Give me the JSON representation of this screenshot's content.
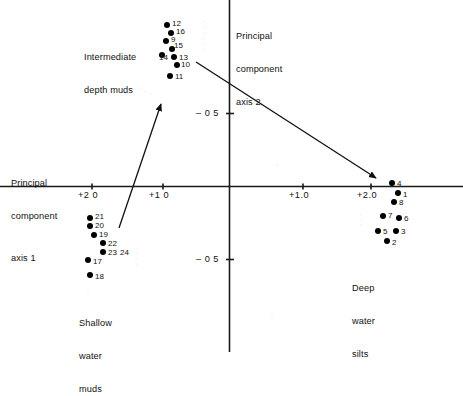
{
  "chart_data": {
    "type": "scatter",
    "title": "",
    "xlabel": "Principal component axis 1",
    "ylabel": "Principal component axis 2",
    "axis1_label_lines": [
      "Principal",
      "component",
      "axis 1"
    ],
    "axis2_label_lines": [
      "Principal",
      "component",
      "axis 2"
    ],
    "xlim": [
      -2.55,
      2.8
    ],
    "ylim": [
      -1.0,
      1.0
    ],
    "grid": false,
    "legend": "none",
    "x_ticks": [
      {
        "label": "+2 0",
        "value": -2.0
      },
      {
        "label": "+1 0",
        "value": -1.0
      },
      {
        "label": "+1.0",
        "value": 1.0
      },
      {
        "label": "+2.0",
        "value": 2.0
      }
    ],
    "y_ticks": [
      {
        "label": "– 0 5",
        "value": 0.5
      },
      {
        "label": "– 0 5",
        "value": -0.5
      }
    ],
    "annotations": [
      {
        "name": "intermediate-depth-muds",
        "lines": [
          "Intermediate",
          "depth muds"
        ]
      },
      {
        "name": "shallow-water-muds",
        "lines": [
          "Shallow",
          "water",
          "muds"
        ]
      },
      {
        "name": "deep-water-silts",
        "lines": [
          "Deep",
          "water",
          "silts"
        ]
      }
    ],
    "arrows": [
      {
        "name": "arrow-to-intermediate-muds",
        "x1": 119,
        "y1": 228,
        "x2": 161,
        "y2": 104
      },
      {
        "name": "arrow-to-deep-silts",
        "x1": 196,
        "y1": 62,
        "x2": 376,
        "y2": 178
      }
    ],
    "groups": [
      {
        "name": "Intermediate depth muds",
        "points": [
          {
            "id": "12",
            "px": 167,
            "py": 25,
            "lx": 172,
            "ly": 20
          },
          {
            "id": "16",
            "px": 171,
            "py": 33,
            "lx": 176,
            "ly": 28
          },
          {
            "id": "9",
            "px": 166,
            "py": 41,
            "lx": 171,
            "ly": 36
          },
          {
            "id": "15",
            "px": 172,
            "py": 49,
            "lx": 174,
            "ly": 42
          },
          {
            "id": "14",
            "px": 162,
            "py": 55,
            "lx": 159,
            "ly": 54
          },
          {
            "id": "13",
            "px": 174,
            "py": 57,
            "lx": 179,
            "ly": 54
          },
          {
            "id": "10",
            "px": 177,
            "py": 65,
            "lx": 181,
            "ly": 61
          },
          {
            "id": "11",
            "px": 170,
            "py": 76,
            "lx": 175,
            "ly": 73
          }
        ]
      },
      {
        "name": "Shallow water muds",
        "points": [
          {
            "id": "21",
            "px": 90,
            "py": 218,
            "lx": 95,
            "ly": 213
          },
          {
            "id": "20",
            "px": 90,
            "py": 226,
            "lx": 95,
            "ly": 222
          },
          {
            "id": "19",
            "px": 94,
            "py": 235,
            "lx": 99,
            "ly": 231
          },
          {
            "id": "22",
            "px": 103,
            "py": 243,
            "lx": 108,
            "ly": 240
          },
          {
            "id": "23",
            "px": 103,
            "py": 252,
            "lx": 108,
            "ly": 249
          },
          {
            "id": "24",
            "px": null,
            "py": null,
            "lx": 120,
            "ly": 249
          },
          {
            "id": "17",
            "px": 88,
            "py": 260,
            "lx": 93,
            "ly": 258
          },
          {
            "id": "18",
            "px": 90,
            "py": 275,
            "lx": 95,
            "ly": 273
          }
        ]
      },
      {
        "name": "Deep water silts",
        "points": [
          {
            "id": "4",
            "px": 392,
            "py": 183,
            "lx": 397,
            "ly": 180
          },
          {
            "id": "1",
            "px": 398,
            "py": 193,
            "lx": 403,
            "ly": 191
          },
          {
            "id": "8",
            "px": 394,
            "py": 202,
            "lx": 399,
            "ly": 199
          },
          {
            "id": "7",
            "px": 383,
            "py": 216,
            "lx": 388,
            "ly": 212
          },
          {
            "id": "6",
            "px": 399,
            "py": 218,
            "lx": 404,
            "ly": 215
          },
          {
            "id": "5",
            "px": 378,
            "py": 231,
            "lx": 383,
            "ly": 228
          },
          {
            "id": "3",
            "px": 396,
            "py": 231,
            "lx": 401,
            "ly": 228
          },
          {
            "id": "2",
            "px": 387,
            "py": 241,
            "lx": 392,
            "ly": 239
          }
        ]
      }
    ]
  },
  "axes": {
    "axis1": {
      "lines": [
        "Principal",
        "component",
        "axis 1"
      ]
    },
    "axis2": {
      "lines": [
        "Principal",
        "component",
        "axis 2"
      ]
    }
  },
  "ticks": {
    "x_left_2": "+2 0",
    "x_left_1": "+1 0",
    "x_right_1": "+1.0",
    "x_right_2": "+2.0",
    "y_upper": "– 0 5",
    "y_lower": "– 0 5"
  },
  "clusters": {
    "intermediate": {
      "line1": "Intermediate",
      "line2": "depth muds"
    },
    "shallow": {
      "line1": "Shallow",
      "line2": "water",
      "line3": "muds"
    },
    "deep": {
      "line1": "Deep",
      "line2": "water",
      "line3": "silts"
    }
  },
  "colors": {
    "axis": "#1a1a1a",
    "point": "#000000",
    "text": "#111111",
    "background": "#ffffff"
  }
}
